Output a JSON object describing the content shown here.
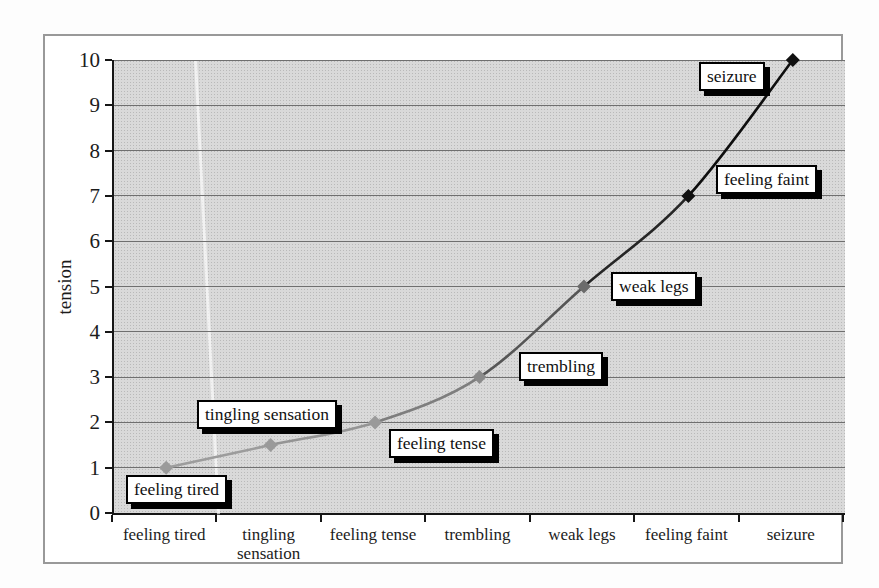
{
  "chart_data": {
    "type": "line",
    "title": "",
    "xlabel": "",
    "ylabel": "tension",
    "ylim": [
      0,
      10
    ],
    "y_ticks": [
      0,
      1,
      2,
      3,
      4,
      5,
      6,
      7,
      8,
      9,
      10
    ],
    "grid": "horizontal",
    "legend": "none",
    "smoothed": true,
    "categories": [
      "feeling tired",
      "tingling sensation",
      "feeling tense",
      "trembling",
      "weak legs",
      "feeling faint",
      "seizure"
    ],
    "values": [
      1,
      1.5,
      2,
      3,
      5,
      7,
      10
    ],
    "point_labels": [
      "feeling tired",
      "tingling sensation",
      "feeling tense",
      "trembling",
      "weak legs",
      "feeling faint",
      "seizure"
    ],
    "colors": {
      "plot_bg": "#d9d9d9",
      "gridline": "#6f6f6f",
      "axis": "#161616",
      "label_box_bg": "#ffffff",
      "label_box_border": "#000000",
      "label_box_shadow": "#000000",
      "frame_border": "#999999"
    },
    "segment_colors": [
      "#9c9c9c",
      "#949494",
      "#7e7e7e",
      "#565656",
      "#262626",
      "#0e0e0e"
    ],
    "marker_colors": [
      "#9a9a9a",
      "#9a9a9a",
      "#9a9a9a",
      "#8a8a8a",
      "#6b6b6b",
      "#111111",
      "#111111"
    ],
    "label_positions": [
      {
        "x": 12,
        "y": 415
      },
      {
        "x": 83,
        "y": 340
      },
      {
        "x": 275,
        "y": 369
      },
      {
        "x": 405,
        "y": 292
      },
      {
        "x": 497,
        "y": 212
      },
      {
        "x": 602,
        "y": 105
      },
      {
        "x": 585,
        "y": 2
      }
    ]
  }
}
